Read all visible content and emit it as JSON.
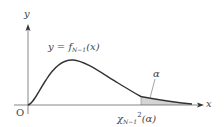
{
  "figure": {
    "y_axis_label": "y",
    "x_axis_label": "x",
    "origin_label": "O",
    "equation": {
      "lhs": "y = f",
      "subscript": "N−1",
      "rhs": "(x)"
    },
    "alpha_label": "α",
    "critical_value": {
      "symbol": "χ",
      "subscript": "N−1",
      "superscript": "2",
      "argument": "(α)"
    },
    "colors": {
      "curve": "#333333",
      "axes": "#555555",
      "shade": "#d4d4d4",
      "text": "#444444"
    }
  }
}
